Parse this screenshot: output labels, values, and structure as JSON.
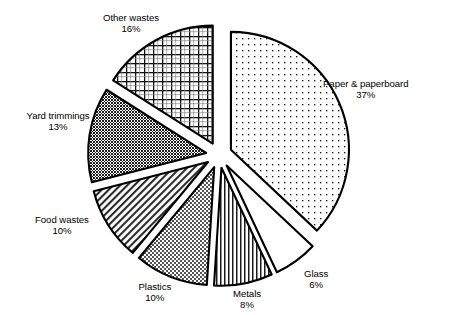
{
  "chart_data": {
    "type": "pie",
    "title": "",
    "subtitle": "",
    "xlabel": "",
    "ylabel": "",
    "legend_position": "none",
    "grid": false,
    "exploded": true,
    "units": "percent",
    "categories": [
      "Paper & paperboard",
      "Glass",
      "Metals",
      "Plastics",
      "Food wastes",
      "Yard trimmings",
      "Other wastes"
    ],
    "values": [
      37,
      6,
      8,
      10,
      10,
      13,
      16
    ],
    "slices": [
      {
        "label": "Paper & paperboard",
        "percent_text": "37%",
        "value": 37,
        "fill_pattern": "fine-dots",
        "fill_color": "#ffffff",
        "stroke_color": "#000000",
        "start_angle_deg": 0,
        "end_angle_deg": 133.2,
        "label_x": 366,
        "label_y": 78
      },
      {
        "label": "Glass",
        "percent_text": "6%",
        "value": 6,
        "fill_pattern": "solid-white",
        "fill_color": "#ffffff",
        "stroke_color": "#000000",
        "start_angle_deg": 133.2,
        "end_angle_deg": 154.8,
        "label_x": 316,
        "label_y": 268
      },
      {
        "label": "Metals",
        "percent_text": "8%",
        "value": 8,
        "fill_pattern": "vertical-lines",
        "fill_color": "#ffffff",
        "stroke_color": "#000000",
        "start_angle_deg": 154.8,
        "end_angle_deg": 183.6,
        "label_x": 247,
        "label_y": 288
      },
      {
        "label": "Plastics",
        "percent_text": "10%",
        "value": 10,
        "fill_pattern": "light-checker",
        "fill_color": "#ffffff",
        "stroke_color": "#000000",
        "start_angle_deg": 183.6,
        "end_angle_deg": 219.6,
        "label_x": 155,
        "label_y": 281
      },
      {
        "label": "Food wastes",
        "percent_text": "10%",
        "value": 10,
        "fill_pattern": "diagonal-hatch",
        "fill_color": "#ffffff",
        "stroke_color": "#000000",
        "start_angle_deg": 219.6,
        "end_angle_deg": 255.6,
        "label_x": 62,
        "label_y": 214
      },
      {
        "label": "Yard trimmings",
        "percent_text": "13%",
        "value": 13,
        "fill_pattern": "dark-checker",
        "fill_color": "#ffffff",
        "stroke_color": "#000000",
        "start_angle_deg": 255.6,
        "end_angle_deg": 302.4,
        "label_x": 58,
        "label_y": 110
      },
      {
        "label": "Other wastes",
        "percent_text": "16%",
        "value": 16,
        "fill_pattern": "grid-crosshatch",
        "fill_color": "#ffffff",
        "stroke_color": "#000000",
        "start_angle_deg": 302.4,
        "end_angle_deg": 360,
        "label_x": 131,
        "label_y": 12
      }
    ],
    "geometry": {
      "center_x": 219,
      "center_y": 155,
      "radius": 118,
      "explode_offset": 13,
      "start_offset_deg": -90
    }
  }
}
